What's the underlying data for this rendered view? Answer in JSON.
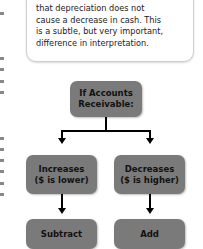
{
  "callout": {
    "lines": [
      "that depreciation does not",
      "cause a decrease in cash. This",
      "is a subtle, but very important,",
      "difference in interpretation."
    ]
  },
  "flowchart": {
    "root": {
      "line1": "If Accounts",
      "line2": "Receivable:"
    },
    "left": {
      "line1": "Increases",
      "line2": "($ is lower)"
    },
    "right": {
      "line1": "Decreases",
      "line2": "($ is higher)"
    },
    "left_result": "Subtract",
    "right_result": "Add"
  },
  "colors": {
    "box_fill": "#7a7a7a",
    "line": "#000000"
  }
}
